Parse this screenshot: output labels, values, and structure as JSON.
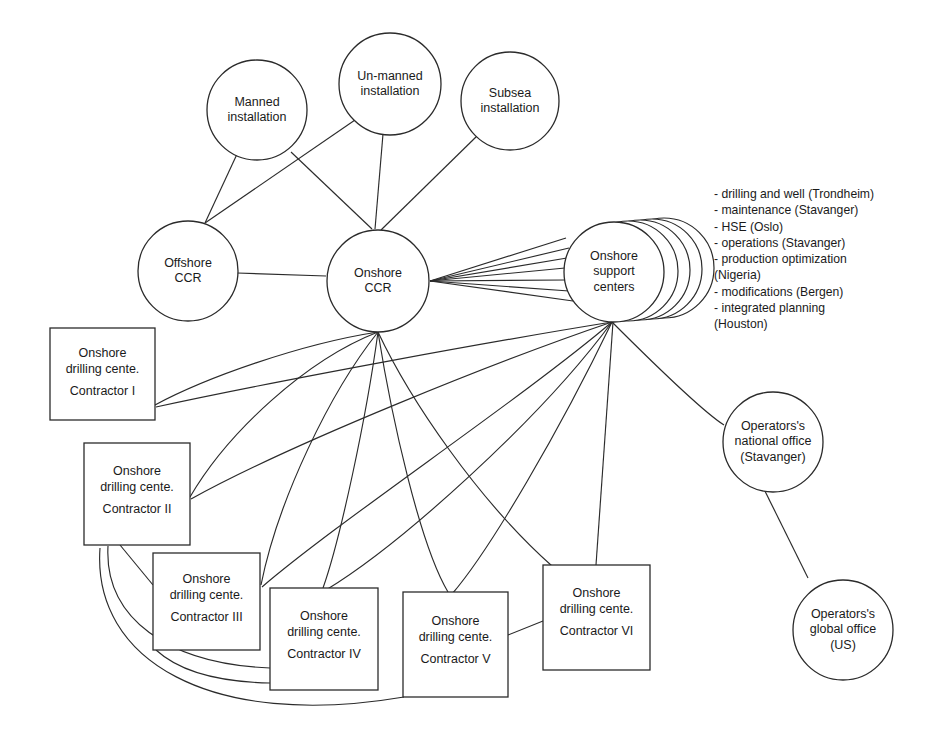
{
  "diagram": {
    "stroke_color": "#2b2b2b",
    "background_color": "#ffffff"
  },
  "nodes": {
    "manned_installation": {
      "label_line1": "Manned",
      "label_line2": "installation"
    },
    "unmanned_installation": {
      "label_line1": "Un-manned",
      "label_line2": "installation"
    },
    "subsea_installation": {
      "label_line1": "Subsea",
      "label_line2": "installation"
    },
    "offshore_ccr": {
      "label_line1": "Offshore",
      "label_line2": "CCR"
    },
    "onshore_ccr": {
      "label_line1": "Onshore",
      "label_line2": "CCR"
    },
    "onshore_support_centers": {
      "label_line1": "Onshore",
      "label_line2": "support",
      "label_line3": "centers"
    },
    "operators_national_office": {
      "label_line1": "Operators's",
      "label_line2": "national office",
      "label_line3": "(Stavanger)"
    },
    "operators_global_office": {
      "label_line1": "Operators's",
      "label_line2": "global office",
      "label_line3": "(US)"
    }
  },
  "support_center_list": {
    "items": [
      "- drilling and well (Trondheim)",
      "- maintenance (Stavanger)",
      "- HSE (Oslo)",
      "- operations (Stavanger)",
      "- production optimization\n(Nigeria)",
      "- modifications (Bergen)",
      "- integrated planning\n(Houston)"
    ]
  },
  "drilling_centers": {
    "common_line1": "Onshore",
    "common_line2": "drilling cente.",
    "boxes": [
      {
        "id": "contractor-1",
        "contractor": "Contractor I"
      },
      {
        "id": "contractor-2",
        "contractor": "Contractor II"
      },
      {
        "id": "contractor-3",
        "contractor": "Contractor III"
      },
      {
        "id": "contractor-4",
        "contractor": "Contractor IV"
      },
      {
        "id": "contractor-5",
        "contractor": "Contractor V"
      },
      {
        "id": "contractor-6",
        "contractor": "Contractor VI"
      }
    ]
  }
}
